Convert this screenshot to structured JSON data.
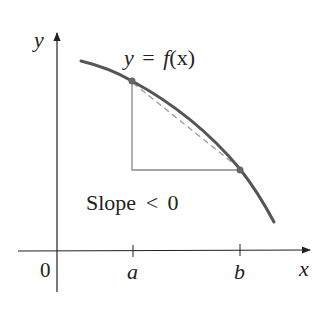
{
  "figure": {
    "axes": {
      "y_label": "y",
      "x_label": "x",
      "origin_label": "0",
      "ticks": [
        {
          "label": "a",
          "x": 133
        },
        {
          "label": "b",
          "x": 240
        }
      ]
    },
    "curve_label": {
      "y": "y",
      "eq": "=",
      "f": "f",
      "arg": "(x)"
    },
    "annotation": {
      "text": "Slope",
      "relation": "<",
      "value": "0"
    },
    "points": [
      {
        "name": "point-a",
        "x": 132,
        "y": 81
      },
      {
        "name": "point-b",
        "x": 240,
        "y": 170
      }
    ],
    "colors": {
      "curve": "#555555",
      "axis": "#222222",
      "triangle": "#888888",
      "secant": "#999999",
      "point": "#666666"
    }
  }
}
